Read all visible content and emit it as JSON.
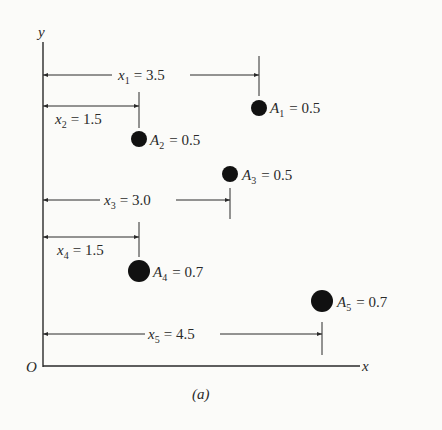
{
  "figure": {
    "caption": "(a)",
    "axes": {
      "x_label": "x",
      "y_label": "y",
      "origin_label": "O"
    },
    "colors": {
      "background": "#fbfbf9",
      "ink": "#2a2a2a"
    },
    "items": [
      {
        "id": 1,
        "x_symbol": "x",
        "x_sub": "1",
        "x_value": "= 3.5",
        "a_symbol": "A",
        "a_sub": "1",
        "a_value": "= 0.5",
        "x": 3.5,
        "area": 0.5
      },
      {
        "id": 2,
        "x_symbol": "x",
        "x_sub": "2",
        "x_value": "= 1.5",
        "a_symbol": "A",
        "a_sub": "2",
        "a_value": "= 0.5",
        "x": 1.5,
        "area": 0.5
      },
      {
        "id": 3,
        "x_symbol": "x",
        "x_sub": "3",
        "x_value": "= 3.0",
        "a_symbol": "A",
        "a_sub": "3",
        "a_value": "= 0.5",
        "x": 3.0,
        "area": 0.5
      },
      {
        "id": 4,
        "x_symbol": "x",
        "x_sub": "4",
        "x_value": "= 1.5",
        "a_symbol": "A",
        "a_sub": "4",
        "a_value": "= 0.7",
        "x": 1.5,
        "area": 0.7
      },
      {
        "id": 5,
        "x_symbol": "x",
        "x_sub": "5",
        "x_value": "= 4.5",
        "a_symbol": "A",
        "a_sub": "5",
        "a_value": "= 0.7",
        "x": 4.5,
        "area": 0.7
      }
    ]
  }
}
